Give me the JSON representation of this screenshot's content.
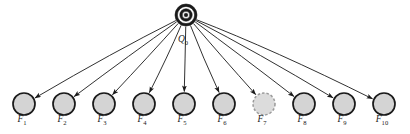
{
  "diagram": {
    "type": "star-topology-graph",
    "canvas": {
      "width": 410,
      "height": 134,
      "background": "#ffffff"
    },
    "root": {
      "name": "root-node",
      "label_base": "Q",
      "label_sub": "0",
      "label_full": "Q0",
      "shape": "concentric-rings",
      "cx": 186,
      "cy": 15,
      "radius": 11,
      "ring_radii": [
        11,
        8.6,
        6.2,
        3.8,
        1.8
      ],
      "ring_colors": [
        "#1a1a1a",
        "#ffffff",
        "#1a1a1a",
        "#ffffff",
        "#1a1a1a"
      ],
      "stroke": "#1a1a1a",
      "label_x": 183,
      "label_y": 42
    },
    "leaf_defaults": {
      "radius": 11,
      "cy": 104,
      "fill": "#d4d4d4",
      "stroke": "#1a1a1a",
      "stroke_width": 1.7,
      "label_dy": 18
    },
    "leaves": [
      {
        "name": "leaf-node-f1",
        "label_base": "F",
        "label_sub": "1",
        "label_full": "F1",
        "cx": 24,
        "style": "solid"
      },
      {
        "name": "leaf-node-f2",
        "label_base": "F",
        "label_sub": "2",
        "label_full": "F2",
        "cx": 64,
        "style": "solid"
      },
      {
        "name": "leaf-node-f3",
        "label_base": "F",
        "label_sub": "3",
        "label_full": "F3",
        "cx": 104,
        "style": "solid"
      },
      {
        "name": "leaf-node-f4",
        "label_base": "F",
        "label_sub": "4",
        "label_full": "F4",
        "cx": 144,
        "style": "solid"
      },
      {
        "name": "leaf-node-f5",
        "label_base": "F",
        "label_sub": "5",
        "label_full": "F5",
        "cx": 184,
        "style": "solid"
      },
      {
        "name": "leaf-node-f6",
        "label_base": "F",
        "label_sub": "6",
        "label_full": "F6",
        "cx": 224,
        "style": "solid"
      },
      {
        "name": "leaf-node-f7",
        "label_base": "F",
        "label_sub": "7",
        "label_full": "F7",
        "cx": 264,
        "style": "dashed"
      },
      {
        "name": "leaf-node-f8",
        "label_base": "F",
        "label_sub": "8",
        "label_full": "F8",
        "cx": 304,
        "style": "solid"
      },
      {
        "name": "leaf-node-f9",
        "label_base": "F",
        "label_sub": "9",
        "label_full": "F9",
        "cx": 344,
        "style": "solid"
      },
      {
        "name": "leaf-node-f10",
        "label_base": "F",
        "label_sub": "10",
        "label_full": "F10",
        "cx": 384,
        "style": "solid"
      }
    ],
    "dashed_style": {
      "fill": "#dcdcdc",
      "stroke": "#9a9a9a",
      "dash_array": "2.5,2",
      "stroke_width": 1.5
    },
    "edges": {
      "name": "root-to-leaf-edges",
      "count": 10,
      "stroke": "#1a1a1a",
      "stroke_width": 0.9,
      "arrowhead": "filled-triangle",
      "curvature": "slight-bow"
    },
    "colors": {
      "node_fill": "#d4d4d4",
      "node_stroke": "#1a1a1a",
      "dashed_node_fill": "#dcdcdc",
      "dashed_node_stroke": "#9a9a9a",
      "edge": "#1a1a1a",
      "text": "#1a1a1a",
      "background": "#ffffff"
    }
  }
}
